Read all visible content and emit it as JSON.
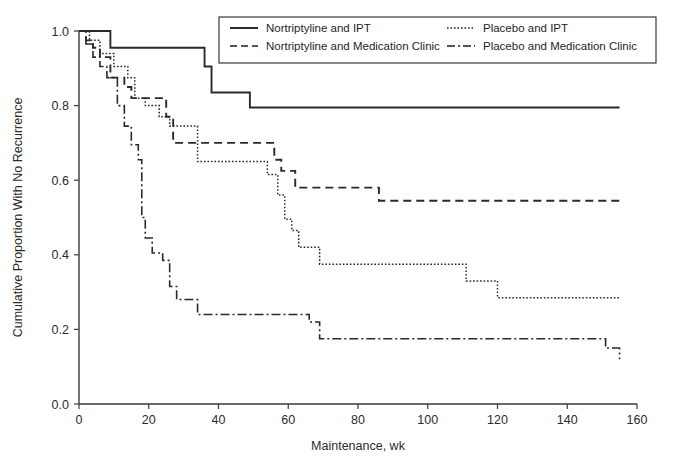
{
  "chart_data": {
    "type": "line",
    "title": "",
    "xlabel": "Maintenance, wk",
    "ylabel": "Cumulative Proportion With No Recurrence",
    "xlim": [
      0,
      160
    ],
    "ylim": [
      0.0,
      1.0
    ],
    "xticks": [
      0,
      20,
      40,
      60,
      80,
      100,
      120,
      140,
      160
    ],
    "xticklabels": [
      "0",
      "20",
      "40",
      "60",
      "80",
      "100",
      "120",
      "140",
      "160"
    ],
    "yticks": [
      0.0,
      0.2,
      0.4,
      0.6,
      0.8,
      1.0
    ],
    "yticklabels": [
      "0.0",
      "0.2",
      "0.4",
      "0.6",
      "0.8",
      "1.0"
    ],
    "grid": false,
    "legend_position": "top-center",
    "step_type": "post",
    "series": [
      {
        "name": "Nortriptyline and IPT",
        "linestyle": "solid",
        "color": "#2a2a2a",
        "x": [
          0,
          2,
          9,
          33,
          36,
          38,
          49,
          155
        ],
        "y": [
          1.0,
          1.0,
          0.955,
          0.955,
          0.905,
          0.835,
          0.795,
          0.795
        ]
      },
      {
        "name": "Nortriptyline and Medication Clinic",
        "linestyle": "dashed",
        "color": "#2a2a2a",
        "x": [
          0,
          2,
          4,
          6,
          9,
          13,
          15,
          25,
          27,
          52,
          56,
          58,
          62,
          86,
          155
        ],
        "y": [
          1.0,
          0.975,
          0.955,
          0.93,
          0.875,
          0.85,
          0.82,
          0.77,
          0.7,
          0.7,
          0.655,
          0.625,
          0.58,
          0.545,
          0.545
        ]
      },
      {
        "name": "Placebo and IPT",
        "linestyle": "dotted",
        "color": "#2a2a2a",
        "x": [
          0,
          3,
          6,
          10,
          14,
          16,
          19,
          23,
          26,
          34,
          49,
          54,
          57,
          59,
          61,
          63,
          69,
          104,
          111,
          120,
          155
        ],
        "y": [
          1.0,
          0.975,
          0.94,
          0.905,
          0.875,
          0.82,
          0.8,
          0.77,
          0.745,
          0.65,
          0.65,
          0.615,
          0.56,
          0.495,
          0.465,
          0.42,
          0.375,
          0.375,
          0.33,
          0.285,
          0.285
        ]
      },
      {
        "name": "Placebo and Medication Clinic",
        "linestyle": "dashdot",
        "color": "#2a2a2a",
        "x": [
          0,
          2,
          4,
          6,
          8,
          11,
          13,
          15,
          17,
          18,
          19,
          21,
          24,
          26,
          28,
          34,
          62,
          66,
          69,
          111,
          151,
          155
        ],
        "y": [
          1.0,
          0.965,
          0.93,
          0.905,
          0.875,
          0.8,
          0.745,
          0.695,
          0.655,
          0.5,
          0.445,
          0.405,
          0.385,
          0.315,
          0.28,
          0.24,
          0.24,
          0.22,
          0.175,
          0.175,
          0.15,
          0.12
        ]
      }
    ]
  },
  "legend": {
    "entries": [
      {
        "label": "Nortriptyline and IPT",
        "style": "solid"
      },
      {
        "label": "Nortriptyline and Medication Clinic",
        "style": "dashed"
      },
      {
        "label": "Placebo and IPT",
        "style": "dotted"
      },
      {
        "label": "Placebo and Medication Clinic",
        "style": "dashdot"
      }
    ]
  }
}
